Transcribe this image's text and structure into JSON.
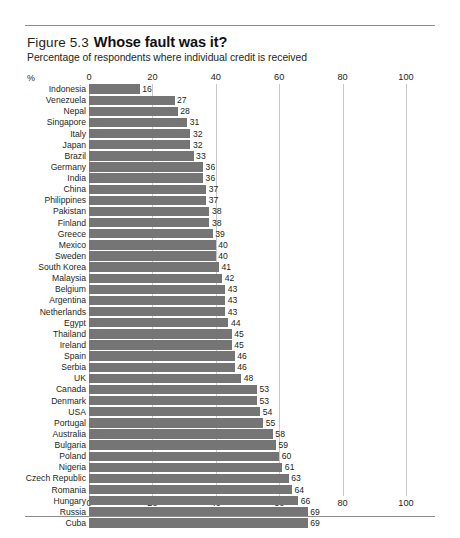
{
  "figure": {
    "number": "Figure 5.3",
    "title": "Whose fault was it?",
    "subtitle": "Percentage of respondents where individual credit is received",
    "unit_label": "%"
  },
  "chart_data": {
    "type": "bar",
    "orientation": "horizontal",
    "title": "Whose fault was it?",
    "subtitle": "Percentage of respondents where individual credit is received",
    "xlabel": "%",
    "ylabel": "",
    "xlim": [
      0,
      100
    ],
    "xticks": [
      0,
      20,
      40,
      60,
      80,
      100
    ],
    "xticklabels": [
      "0",
      "20",
      "40",
      "60",
      "80",
      "100"
    ],
    "grid": true,
    "grid_axis": "x",
    "axis_position": "both",
    "legend": false,
    "bar_color": "#757575",
    "categories": [
      "Indonesia",
      "Venezuela",
      "Nepal",
      "Singapore",
      "Italy",
      "Japan",
      "Brazil",
      "Germany",
      "India",
      "China",
      "Philippines",
      "Pakistan",
      "Finland",
      "Greece",
      "Mexico",
      "Sweden",
      "South Korea",
      "Malaysia",
      "Belgium",
      "Argentina",
      "Netherlands",
      "Egypt",
      "Thailand",
      "Ireland",
      "Spain",
      "Serbia",
      "UK",
      "Canada",
      "Denmark",
      "USA",
      "Portugal",
      "Australia",
      "Bulgaria",
      "Poland",
      "Nigeria",
      "Czech Republic",
      "Romania",
      "Hungary",
      "Russia",
      "Cuba"
    ],
    "values": [
      16,
      27,
      28,
      31,
      32,
      32,
      33,
      36,
      36,
      37,
      37,
      38,
      38,
      39,
      40,
      40,
      41,
      42,
      43,
      43,
      43,
      44,
      45,
      45,
      46,
      46,
      48,
      53,
      53,
      54,
      55,
      58,
      59,
      60,
      61,
      63,
      64,
      66,
      69,
      69
    ]
  }
}
